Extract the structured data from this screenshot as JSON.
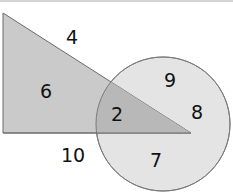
{
  "diagram": {
    "shapes": [
      {
        "name": "triangle",
        "fill": "#c9c9c9",
        "stroke": "#6e6e6e"
      },
      {
        "name": "circle",
        "fill": "#e3e3e3",
        "stroke": "#7a7a7a"
      }
    ],
    "overlap_fill": "#b9b9b9",
    "labels": {
      "outside_top": "4",
      "triangle_only": "6",
      "overlap": "2",
      "circle_top": "9",
      "circle_right": "8",
      "circle_bottom": "7",
      "outside_bottom": "10"
    }
  }
}
